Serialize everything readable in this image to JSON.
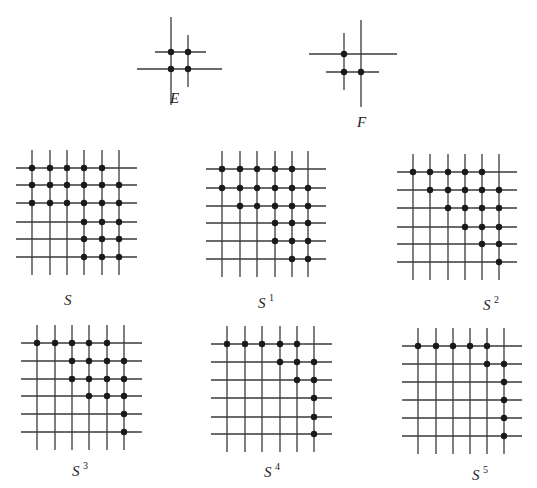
{
  "figures": {
    "E": {
      "label": "E",
      "sup": "",
      "label_pos": [
        170,
        103
      ],
      "lines": [
        [
          171,
          17,
          171,
          105
        ],
        [
          188,
          35,
          188,
          87
        ],
        [
          155,
          52,
          206,
          52
        ],
        [
          137,
          69,
          222,
          69
        ]
      ],
      "dots": [
        [
          171,
          52
        ],
        [
          188,
          52
        ],
        [
          171,
          69
        ],
        [
          188,
          69
        ]
      ]
    },
    "F": {
      "label": "F",
      "sup": "",
      "label_pos": [
        357,
        127
      ],
      "lines": [
        [
          344,
          33,
          344,
          90
        ],
        [
          361,
          20,
          361,
          107
        ],
        [
          309,
          54,
          397,
          54
        ],
        [
          326,
          72,
          379,
          72
        ]
      ],
      "dots": [
        [
          344,
          54
        ],
        [
          344,
          72
        ],
        [
          361,
          72
        ]
      ]
    }
  },
  "grids": [
    {
      "id": "S",
      "label": "S",
      "sup": "",
      "xs": [
        32,
        50,
        67,
        84,
        102,
        119
      ],
      "ys": [
        168,
        185,
        203,
        222,
        239,
        257
      ],
      "label_pos": [
        64,
        305
      ],
      "rows": [
        [
          0,
          1,
          2,
          3,
          4
        ],
        [
          0,
          1,
          2,
          3,
          4,
          5
        ],
        [
          0,
          1,
          2,
          3,
          4,
          5
        ],
        [
          3,
          4,
          5
        ],
        [
          3,
          4,
          5
        ],
        [
          3,
          4,
          5
        ]
      ]
    },
    {
      "id": "S1",
      "label": "S",
      "sup": "1",
      "xs": [
        222,
        240,
        257,
        275,
        292,
        308
      ],
      "ys": [
        169,
        188,
        206,
        223,
        241,
        259
      ],
      "label_pos": [
        258,
        308
      ],
      "rows": [
        [
          0,
          1,
          2,
          3,
          4
        ],
        [
          0,
          1,
          2,
          3,
          4,
          5
        ],
        [
          1,
          2,
          3,
          4,
          5
        ],
        [
          3,
          4,
          5
        ],
        [
          3,
          4,
          5
        ],
        [
          4,
          5
        ]
      ]
    },
    {
      "id": "S2",
      "label": "S",
      "sup": "2",
      "xs": [
        413,
        430,
        448,
        465,
        482,
        499
      ],
      "ys": [
        172,
        190,
        208,
        227,
        244,
        262
      ],
      "label_pos": [
        483,
        310
      ],
      "rows": [
        [
          0,
          1,
          2,
          3,
          4
        ],
        [
          1,
          2,
          3,
          4,
          5
        ],
        [
          2,
          3,
          4,
          5
        ],
        [
          3,
          4,
          5
        ],
        [
          4,
          5
        ],
        [
          5
        ]
      ]
    },
    {
      "id": "S3",
      "label": "S",
      "sup": "3",
      "xs": [
        37,
        55,
        72,
        89,
        107,
        124
      ],
      "ys": [
        343,
        361,
        379,
        396,
        414,
        432
      ],
      "label_pos": [
        72,
        476
      ],
      "rows": [
        [
          0,
          1,
          2,
          3,
          4
        ],
        [
          2,
          3,
          4,
          5
        ],
        [
          2,
          3,
          4,
          5
        ],
        [
          3,
          4,
          5
        ],
        [
          5
        ],
        [
          5
        ]
      ]
    },
    {
      "id": "S4",
      "label": "S",
      "sup": "4",
      "xs": [
        227,
        245,
        262,
        280,
        297,
        314
      ],
      "ys": [
        344,
        362,
        380,
        398,
        417,
        434
      ],
      "label_pos": [
        264,
        477
      ],
      "rows": [
        [
          0,
          1,
          2,
          3,
          4
        ],
        [
          3,
          4,
          5
        ],
        [
          4,
          5
        ],
        [
          5
        ],
        [
          5
        ],
        [
          5
        ]
      ]
    },
    {
      "id": "S5",
      "label": "S",
      "sup": "5",
      "xs": [
        418,
        436,
        453,
        470,
        487,
        504
      ],
      "ys": [
        346,
        364,
        382,
        400,
        418,
        436
      ],
      "label_pos": [
        472,
        480
      ],
      "rows": [
        [
          0,
          1,
          2,
          3,
          4
        ],
        [
          4,
          5
        ],
        [
          5
        ],
        [
          5
        ],
        [
          5
        ],
        [
          5
        ]
      ]
    }
  ]
}
